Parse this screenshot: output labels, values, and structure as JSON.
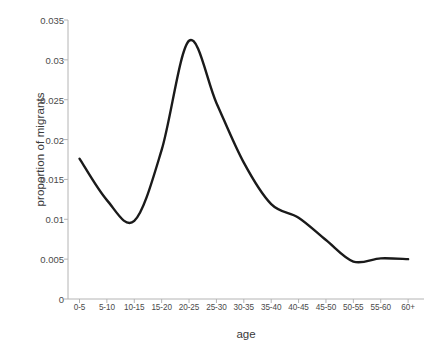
{
  "chart_data": {
    "type": "line",
    "title": "",
    "xlabel": "age",
    "ylabel": "proportion of migrants",
    "categories": [
      "0-5",
      "5-10",
      "10-15",
      "15-20",
      "20-25",
      "25-30",
      "30-35",
      "35-40",
      "40-45",
      "45-50",
      "50-55",
      "55-60",
      "60+"
    ],
    "values": [
      0.0176,
      0.0124,
      0.0098,
      0.0187,
      0.0324,
      0.0246,
      0.0171,
      0.0119,
      0.0102,
      0.0074,
      0.0047,
      0.0051,
      0.005
    ],
    "ylim": [
      0,
      0.035
    ],
    "yticks": [
      0,
      0.005,
      0.01,
      0.015,
      0.02,
      0.025,
      0.03,
      0.035
    ],
    "ytick_labels": [
      "0",
      "0.005",
      "0.01",
      "0.015",
      "0.02",
      "0.025",
      "0.03",
      "0.035"
    ],
    "grid": false,
    "legend": false,
    "line_color": "#1a1a1a",
    "line_width": 2.4,
    "smoothing": "spline",
    "axis_color": "#b0b0b0",
    "background": "#ffffff"
  }
}
